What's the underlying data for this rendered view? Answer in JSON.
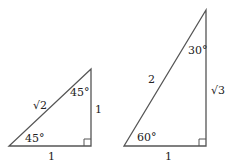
{
  "triangle_45": {
    "hypotenuse": "√2",
    "vertical_leg": "1",
    "base": "1",
    "angle_bottom": "45°",
    "angle_top": "45°"
  },
  "triangle_30_60": {
    "hypotenuse": "2",
    "vertical_leg": "√3",
    "base": "1",
    "angle_bottom": "60°",
    "angle_top": "30°"
  },
  "colors": {
    "stroke": "#555555",
    "text": "#222222"
  }
}
